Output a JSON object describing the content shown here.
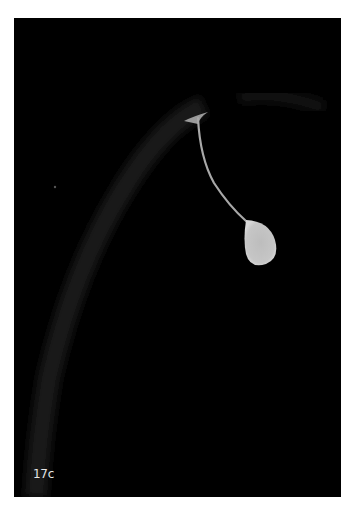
{
  "figure": {
    "panel_label": "17c",
    "colors": {
      "background": "#000000",
      "droplet": "#c8c8c8",
      "arc": "#1c1c1c",
      "label": "#e6e6e6"
    }
  }
}
